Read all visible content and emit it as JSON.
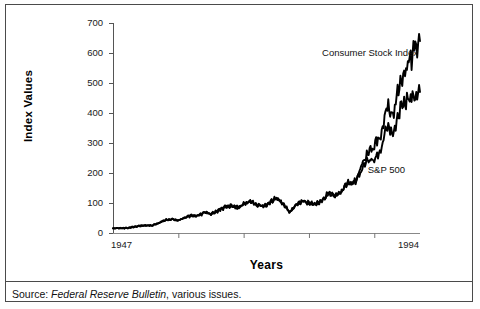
{
  "figure": {
    "clipped_top_text": "",
    "source_prefix": "Source:",
    "source_italic": "Federal Reserve Bulletin",
    "source_rest": ", various issues."
  },
  "chart_data": {
    "type": "line",
    "title": "",
    "xlabel": "Years",
    "ylabel": "Index Values",
    "xlim": [
      1947,
      1994
    ],
    "ylim": [
      0,
      700
    ],
    "grid": false,
    "legend_position": "inline-annotations",
    "yticks": [
      0,
      100,
      200,
      300,
      400,
      500,
      600,
      700
    ],
    "ytick_labels": [
      "0",
      "100",
      "200",
      "300",
      "400",
      "500",
      "600",
      "700"
    ],
    "xtick_labels": [
      "1947",
      "1994"
    ],
    "xtick_positions": [
      1947,
      1994
    ],
    "xtick_marks_years": [
      1957,
      1967,
      1977,
      1987
    ],
    "annotations": [
      {
        "text": "Consumer Stock Index",
        "x": 1979,
        "y": 600
      },
      {
        "text": "S&P 500",
        "x": 1986,
        "y": 210
      }
    ],
    "series": [
      {
        "name": "Consumer Stock Index",
        "color": "#000000",
        "x": [
          1947,
          1948,
          1949,
          1950,
          1951,
          1952,
          1953,
          1954,
          1955,
          1956,
          1957,
          1958,
          1959,
          1960,
          1961,
          1962,
          1963,
          1964,
          1965,
          1966,
          1967,
          1968,
          1969,
          1970,
          1971,
          1972,
          1973,
          1974,
          1975,
          1976,
          1977,
          1978,
          1979,
          1980,
          1981,
          1982,
          1983,
          1984,
          1985,
          1986,
          1987,
          1988,
          1989,
          1990,
          1991,
          1992,
          1993,
          1994
        ],
        "values": [
          15,
          16,
          16,
          20,
          24,
          26,
          25,
          33,
          42,
          45,
          41,
          50,
          58,
          57,
          68,
          63,
          73,
          84,
          90,
          86,
          96,
          104,
          95,
          87,
          100,
          115,
          99,
          70,
          92,
          107,
          99,
          98,
          105,
          126,
          124,
          138,
          168,
          170,
          218,
          268,
          290,
          322,
          420,
          400,
          505,
          540,
          600,
          640
        ]
      },
      {
        "name": "S&P 500",
        "color": "#000000",
        "x": [
          1947,
          1948,
          1949,
          1950,
          1951,
          1952,
          1953,
          1954,
          1955,
          1956,
          1957,
          1958,
          1959,
          1960,
          1961,
          1962,
          1963,
          1964,
          1965,
          1966,
          1967,
          1968,
          1969,
          1970,
          1971,
          1972,
          1973,
          1974,
          1975,
          1976,
          1977,
          1978,
          1979,
          1980,
          1981,
          1982,
          1983,
          1984,
          1985,
          1986,
          1987,
          1988,
          1989,
          1990,
          1991,
          1992,
          1993,
          1994
        ],
        "values": [
          15,
          16,
          16,
          19,
          23,
          25,
          25,
          33,
          44,
          46,
          41,
          52,
          59,
          57,
          71,
          63,
          74,
          85,
          92,
          81,
          96,
          104,
          92,
          92,
          102,
          118,
          98,
          69,
          90,
          107,
          95,
          96,
          108,
          136,
          123,
          141,
          165,
          167,
          211,
          242,
          247,
          278,
          353,
          330,
          417,
          436,
          466,
          470
        ]
      }
    ]
  }
}
